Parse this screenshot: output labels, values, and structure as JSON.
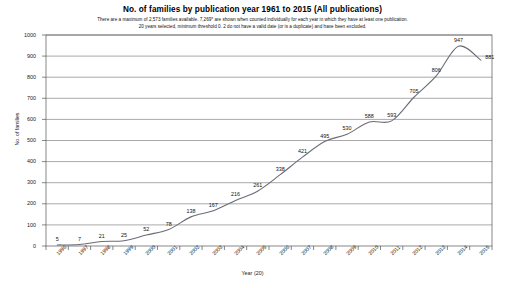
{
  "chart_data": {
    "type": "line",
    "title": "No. of families by publication year 1961 to 2015 (All publications)",
    "subtitle_line1": "There are a maximum of 2,573 families available. 7,269* are shown when counted individually for each year in which they have at least one publication.",
    "subtitle_line2": "20 years selected, minimum threshold 0. 2 do not have a valid date (or is a duplicate) and have been excluded.",
    "xlabel": "Year (20)",
    "ylabel": "No. of families",
    "categories": [
      "1996",
      "1997",
      "1998",
      "1999",
      "2000",
      "2001",
      "2002",
      "2003",
      "2004",
      "2005",
      "2006",
      "2007",
      "2008",
      "2009",
      "2010",
      "2011",
      "2012",
      "2013",
      "2014",
      "2015"
    ],
    "values": [
      5,
      7,
      21,
      25,
      52,
      78,
      138,
      167,
      216,
      261,
      338,
      421,
      495,
      530,
      588,
      593,
      705,
      806,
      947,
      881
    ],
    "ylim": [
      0,
      1000
    ],
    "ytick_labels": [
      "0",
      "100",
      "200",
      "300",
      "400",
      "500",
      "600",
      "700",
      "800",
      "900",
      "1000"
    ],
    "ytick_values": [
      0,
      100,
      200,
      300,
      400,
      500,
      600,
      700,
      800,
      900,
      1000
    ],
    "grid": true,
    "legend": "none",
    "line_color": "#6b6b78",
    "point_label_color": "#111111"
  }
}
